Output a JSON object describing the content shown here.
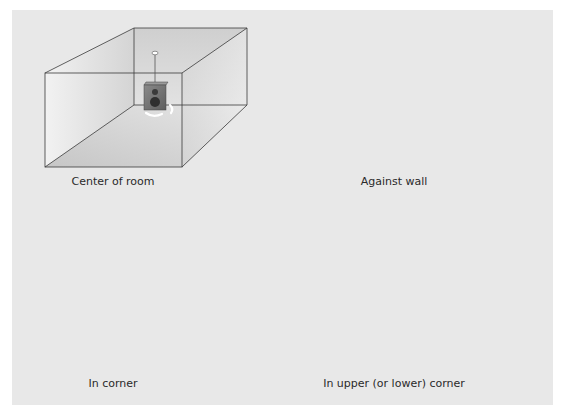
{
  "diagram": {
    "type": "speaker-placement-in-room",
    "background_color": "#e8e8e8",
    "edge_color": "#3a3a3a",
    "speaker_color": "#6e6e6e",
    "wave_color": "#ffffff",
    "panels": [
      {
        "id": "center",
        "caption": "Center of room",
        "speaker_position": "suspended from ceiling, center",
        "wave_arcs": 2
      },
      {
        "id": "wall",
        "caption": "Against wall",
        "speaker_position": "on back-left wall",
        "wave_arcs": 4
      },
      {
        "id": "corner",
        "caption": "In corner",
        "speaker_position": "back vertical corner edge",
        "wave_arcs": 10
      },
      {
        "id": "upper-corner",
        "caption": "In upper (or lower) corner",
        "speaker_position": "upper back corner",
        "wave_arcs": 24
      }
    ]
  }
}
